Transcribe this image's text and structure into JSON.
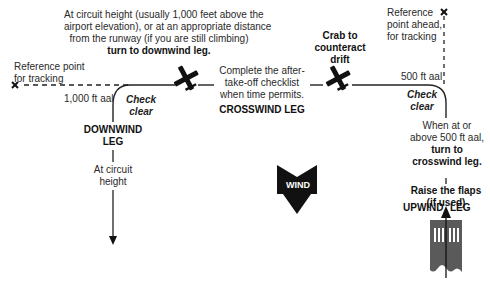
{
  "downwind_turn": {
    "line1": "At circuit height (usually 1,000 feet above the",
    "line2": "airport elevation), or at an appropriate distance",
    "line3": "from the runway (if you are still climbing)",
    "line4": "turn to downwind leg."
  },
  "ref_point_left": {
    "line1": "Reference point",
    "line2": "for tracking"
  },
  "ref_point_right": {
    "line1": "Reference",
    "line2": "point ahead,",
    "line3": "for tracking"
  },
  "alt_left": "1,000 ft aal",
  "alt_right": "500 ft aal",
  "check_clear_left": {
    "line1": "Check",
    "line2": "clear"
  },
  "check_clear_right": {
    "line1": "Check",
    "line2": "clear"
  },
  "checklist": {
    "line1": "Complete the after-",
    "line2": "take-off checklist",
    "line3": "when time permits."
  },
  "crab": {
    "line1": "Crab to",
    "line2": "counteract",
    "line3": "drift"
  },
  "crosswind_leg": "CROSSWIND LEG",
  "downwind_leg": {
    "line1": "DOWNWIND",
    "line2": "LEG"
  },
  "circuit_height": {
    "line1": "At circuit",
    "line2": "height"
  },
  "crosswind_turn": {
    "line1": "When at or",
    "line2": "above 500 ft aal,",
    "line3": "turn to",
    "line4": "crosswind leg."
  },
  "flaps": {
    "line1": "Raise the flaps",
    "line2": "(if used)"
  },
  "upwind_leg": {
    "left": "UPWIND",
    "right": "LEG"
  },
  "wind": "WIND",
  "runway_number": "21",
  "colors": {
    "line": "#1a1a1a",
    "runway": "#5a5a5a",
    "arrow": "#111111"
  }
}
